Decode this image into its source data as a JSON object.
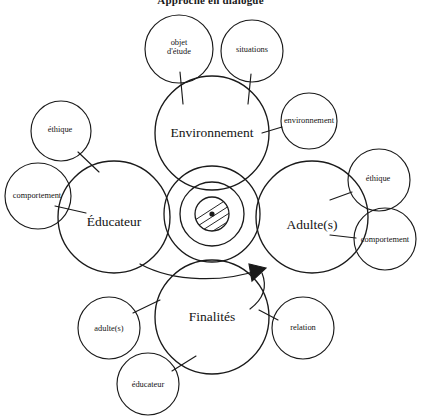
{
  "title": "Approche en dialogue",
  "diagram": {
    "type": "concentric-circle-concept-map",
    "stroke_color": "#1a1a1a",
    "background_color": "#ffffff",
    "center": {
      "name": "core-spiral",
      "description": "three concentric circles with hatched inner core and center dot",
      "cx": 212,
      "cy": 214,
      "radii": [
        48,
        32,
        17
      ],
      "hatch_lines": 5,
      "dot_radius": 2.6
    },
    "main_nodes": [
      {
        "id": "environnement",
        "label": "Environnement",
        "cx": 212,
        "cy": 133,
        "r": 57
      },
      {
        "id": "educateur",
        "label": "Éducateur",
        "cx": 114,
        "cy": 217,
        "r": 56
      },
      {
        "id": "adultes",
        "label": "Adulte(s)",
        "cx": 312,
        "cy": 217,
        "r": 56
      },
      {
        "id": "finalites",
        "label": "Finalités",
        "cx": 212,
        "cy": 317,
        "r": 57
      }
    ],
    "satellite_nodes": [
      {
        "id": "objet-etude",
        "label": "objet\nd'étude",
        "cx": 179,
        "cy": 49,
        "r": 34,
        "parent": "environnement"
      },
      {
        "id": "situations",
        "label": "situations",
        "cx": 252,
        "cy": 51,
        "r": 31,
        "parent": "environnement"
      },
      {
        "id": "environnement-sat",
        "label": "environnement",
        "cx": 309,
        "cy": 121,
        "r": 28,
        "parent": "environnement"
      },
      {
        "id": "ethique-left",
        "label": "éthique",
        "cx": 61,
        "cy": 131,
        "r": 30,
        "parent": "educateur"
      },
      {
        "id": "comportement-left",
        "label": "comportement",
        "cx": 38,
        "cy": 196,
        "r": 33,
        "parent": "educateur"
      },
      {
        "id": "ethique-right",
        "label": "éthique",
        "cx": 379,
        "cy": 180,
        "r": 31,
        "parent": "adultes"
      },
      {
        "id": "comportement-right",
        "label": "comportement",
        "cx": 385,
        "cy": 239,
        "r": 31,
        "parent": "adultes"
      },
      {
        "id": "adultes-sat",
        "label": "adulte(s)",
        "cx": 109,
        "cy": 328,
        "r": 31,
        "parent": "finalites"
      },
      {
        "id": "relation",
        "label": "relation",
        "cx": 303,
        "cy": 328,
        "r": 31,
        "parent": "finalites"
      },
      {
        "id": "educateur-sat",
        "label": "éducateur",
        "cx": 148,
        "cy": 384,
        "r": 31,
        "parent": "finalites"
      }
    ],
    "arrow": {
      "name": "flow-arrow",
      "description": "arc from Éducateur area sweeping to centre pointing up-right",
      "tip_x": 264,
      "tip_y": 272
    }
  }
}
